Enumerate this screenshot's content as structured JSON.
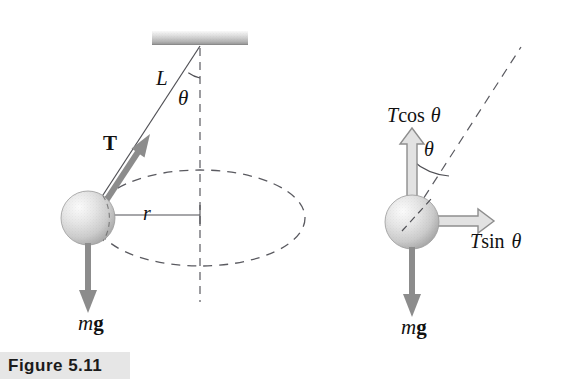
{
  "figure": {
    "caption": "Figure 5.11",
    "caption_band_color": "#e6e6e6",
    "caption_text_color": "#1b1b1b",
    "background_color": "#ffffff"
  },
  "left_diagram": {
    "name": "conical-pendulum-perspective",
    "ceiling": {
      "name": "ceiling-support",
      "fill_top": "#f2f2f2",
      "fill_bottom": "#9a9a9a"
    },
    "string_label": "L",
    "angle_label": "θ",
    "tension_label": "T",
    "radius_label": "r",
    "weight_label_m": "m",
    "weight_label_g": "g",
    "path_note": "dashed ellipse: horizontal circular path seen in perspective",
    "vector_color": "#8c8c8c",
    "line_color": "#55555a",
    "sphere_fill_light": "#f4f4f4",
    "sphere_fill_dark": "#a8a8a8"
  },
  "right_diagram": {
    "name": "free-body-diagram",
    "angle_label": "θ",
    "t_cos_label_t": "T",
    "t_cos_label_fn": "cos",
    "t_cos_label_theta": "θ",
    "t_sin_label_t": "T",
    "t_sin_label_fn": "sin",
    "t_sin_label_theta": "θ",
    "weight_label_m": "m",
    "weight_label_g": "g",
    "component_arrow_style": "hollow-outline",
    "weight_arrow_style": "solid-gray",
    "vector_color": "#8c8c8c",
    "line_color": "#55555a"
  }
}
